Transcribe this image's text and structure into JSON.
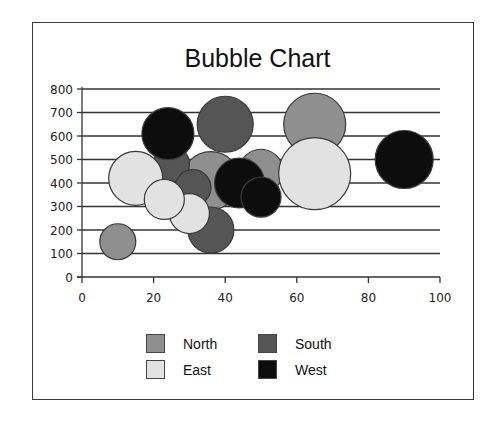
{
  "chart_data": {
    "type": "bubble",
    "title": "Bubble Chart",
    "xlabel": "",
    "ylabel": "",
    "xlim": [
      0,
      100
    ],
    "ylim": [
      0,
      800
    ],
    "x_ticks": [
      0,
      20,
      40,
      60,
      80,
      100
    ],
    "y_ticks": [
      0,
      100,
      200,
      300,
      400,
      500,
      600,
      700,
      800
    ],
    "grid": {
      "horizontal": true,
      "vertical": false
    },
    "legend_position": "bottom",
    "series": [
      {
        "name": "North",
        "color": "#8f8f8f",
        "points": [
          {
            "x": 10,
            "y": 150,
            "size": 18
          },
          {
            "x": 36,
            "y": 410,
            "size": 29
          },
          {
            "x": 50,
            "y": 450,
            "size": 22
          },
          {
            "x": 65,
            "y": 650,
            "size": 31
          }
        ]
      },
      {
        "name": "South",
        "color": "#555555",
        "points": [
          {
            "x": 25,
            "y": 480,
            "size": 18
          },
          {
            "x": 40,
            "y": 650,
            "size": 28
          },
          {
            "x": 31,
            "y": 380,
            "size": 18
          },
          {
            "x": 36,
            "y": 200,
            "size": 23
          }
        ]
      },
      {
        "name": "East",
        "color": "#e2e2e2",
        "points": [
          {
            "x": 15,
            "y": 420,
            "size": 27
          },
          {
            "x": 30,
            "y": 270,
            "size": 20
          },
          {
            "x": 23,
            "y": 330,
            "size": 20
          },
          {
            "x": 65,
            "y": 440,
            "size": 36
          }
        ]
      },
      {
        "name": "West",
        "color": "#0d0d0d",
        "points": [
          {
            "x": 24,
            "y": 610,
            "size": 26
          },
          {
            "x": 44,
            "y": 400,
            "size": 25
          },
          {
            "x": 50,
            "y": 340,
            "size": 20
          },
          {
            "x": 90,
            "y": 500,
            "size": 29
          }
        ]
      }
    ]
  },
  "legend": {
    "items": [
      {
        "label": "North",
        "color": "#8f8f8f"
      },
      {
        "label": "South",
        "color": "#555555"
      },
      {
        "label": "East",
        "color": "#e2e2e2"
      },
      {
        "label": "West",
        "color": "#0d0d0d"
      }
    ]
  }
}
